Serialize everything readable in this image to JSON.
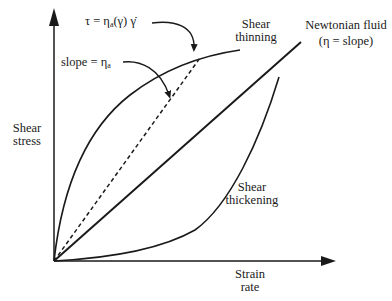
{
  "diagram": {
    "axes": {
      "y_label_line1": "Shear",
      "y_label_line2": "stress",
      "x_label_line1": "Strain",
      "x_label_line2": "rate"
    },
    "curves": {
      "thinning_line1": "Shear",
      "thinning_line2": "thinning",
      "newtonian_line1": "Newtonian fluid",
      "newtonian_line2": "(η = slope)",
      "thickening_line1": "Shear",
      "thickening_line2": "thickening"
    },
    "annotations": {
      "tau_lhs": "τ = η",
      "tau_sub": "a",
      "tau_rhs": "(γ) γ̇",
      "slope_lhs": "slope = η",
      "slope_sub": "a"
    },
    "colors": {
      "ink": "#1a1a1a",
      "background": "#ffffff"
    }
  }
}
